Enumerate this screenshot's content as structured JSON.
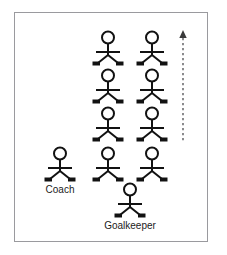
{
  "diagram": {
    "background_color": "#ffffff",
    "frame": {
      "border_color": "#9a9a9e",
      "x": 14,
      "y": 12,
      "width": 194,
      "height": 230
    },
    "figure_style": {
      "stroke_color": "#121212",
      "fill_color": "#ffffff",
      "foot_color": "#121212"
    },
    "figures": [
      {
        "id": "player-r1-c1",
        "label": "",
        "x": 108,
        "y": 30
      },
      {
        "id": "player-r1-c2",
        "label": "",
        "x": 152,
        "y": 30
      },
      {
        "id": "player-r2-c1",
        "label": "",
        "x": 108,
        "y": 68
      },
      {
        "id": "player-r2-c2",
        "label": "",
        "x": 152,
        "y": 68
      },
      {
        "id": "player-r3-c1",
        "label": "",
        "x": 108,
        "y": 106
      },
      {
        "id": "player-r3-c2",
        "label": "",
        "x": 152,
        "y": 106
      },
      {
        "id": "coach",
        "label": "Coach",
        "x": 60,
        "y": 146
      },
      {
        "id": "player-r4-c1",
        "label": "",
        "x": 108,
        "y": 146
      },
      {
        "id": "player-r4-c2",
        "label": "",
        "x": 152,
        "y": 146
      },
      {
        "id": "goalkeeper",
        "label": "Goalkeeper",
        "x": 130,
        "y": 182
      }
    ],
    "labels": [
      {
        "id": "coach-label",
        "text": "Coach",
        "x": 60,
        "y": 184
      },
      {
        "id": "goalkeeper-label",
        "text": "Goalkeeper",
        "x": 130,
        "y": 220
      }
    ],
    "arrow": {
      "id": "direction-arrow",
      "style": "dashed",
      "direction": "up",
      "color": "#3a3a3a",
      "x": 183,
      "y_top": 30,
      "y_bottom": 140
    }
  }
}
